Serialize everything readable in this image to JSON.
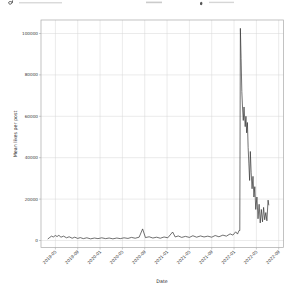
{
  "chart_data": {
    "type": "line",
    "xlabel": "Date",
    "ylabel": "Mean likes per post",
    "grid": true,
    "legend": "none",
    "line_color": "#333333",
    "grid_color": "#d6d6d6",
    "spine_color": "#a8a8a8",
    "xlim": [
      "2019-02-15",
      "2022-10-01"
    ],
    "ylim": [
      -3500,
      106500
    ],
    "x_tick_labels": [
      "2019-05",
      "2019-09",
      "2020-01",
      "2020-05",
      "2020-09",
      "2021-01",
      "2021-05",
      "2021-09",
      "2022-01",
      "2022-05",
      "2022-09"
    ],
    "y_ticks": [
      [
        0,
        "0"
      ],
      [
        20000,
        "20000"
      ],
      [
        40000,
        "40000"
      ],
      [
        60000,
        "60000"
      ],
      [
        80000,
        "80000"
      ],
      [
        100000,
        "100000"
      ]
    ],
    "series": [
      {
        "name": "mean-likes-per-post",
        "points": [
          [
            "2019-03-20",
            700
          ],
          [
            "2019-04-01",
            1500
          ],
          [
            "2019-04-10",
            2100
          ],
          [
            "2019-04-20",
            1700
          ],
          [
            "2019-05-01",
            2400
          ],
          [
            "2019-05-10",
            1900
          ],
          [
            "2019-05-20",
            2500
          ],
          [
            "2019-06-01",
            1600
          ],
          [
            "2019-06-15",
            2100
          ],
          [
            "2019-07-01",
            1300
          ],
          [
            "2019-07-15",
            1800
          ],
          [
            "2019-08-01",
            1100
          ],
          [
            "2019-08-15",
            1600
          ],
          [
            "2019-09-01",
            1000
          ],
          [
            "2019-09-15",
            1400
          ],
          [
            "2019-10-01",
            900
          ],
          [
            "2019-10-20",
            1300
          ],
          [
            "2019-11-10",
            800
          ],
          [
            "2019-12-01",
            1200
          ],
          [
            "2019-12-20",
            900
          ],
          [
            "2020-01-10",
            1300
          ],
          [
            "2020-02-01",
            900
          ],
          [
            "2020-02-20",
            1200
          ],
          [
            "2020-03-10",
            800
          ],
          [
            "2020-04-01",
            1200
          ],
          [
            "2020-04-20",
            900
          ],
          [
            "2020-05-10",
            1300
          ],
          [
            "2020-06-01",
            1000
          ],
          [
            "2020-06-20",
            1500
          ],
          [
            "2020-07-10",
            1100
          ],
          [
            "2020-08-01",
            1600
          ],
          [
            "2020-08-20",
            5600
          ],
          [
            "2020-09-05",
            1400
          ],
          [
            "2020-09-25",
            1800
          ],
          [
            "2020-10-15",
            1200
          ],
          [
            "2020-11-05",
            1600
          ],
          [
            "2020-11-25",
            1100
          ],
          [
            "2020-12-15",
            1700
          ],
          [
            "2021-01-05",
            1300
          ],
          [
            "2021-02-01",
            4100
          ],
          [
            "2021-02-15",
            1700
          ],
          [
            "2021-03-01",
            2200
          ],
          [
            "2021-03-20",
            1500
          ],
          [
            "2021-04-10",
            2000
          ],
          [
            "2021-05-01",
            1500
          ],
          [
            "2021-05-20",
            2300
          ],
          [
            "2021-06-10",
            1600
          ],
          [
            "2021-07-01",
            2200
          ],
          [
            "2021-07-20",
            1700
          ],
          [
            "2021-08-10",
            2100
          ],
          [
            "2021-09-01",
            1600
          ],
          [
            "2021-09-20",
            2400
          ],
          [
            "2021-10-10",
            1800
          ],
          [
            "2021-11-01",
            2600
          ],
          [
            "2021-11-20",
            2100
          ],
          [
            "2021-12-10",
            3200
          ],
          [
            "2021-12-25",
            2600
          ],
          [
            "2022-01-10",
            4200
          ],
          [
            "2022-01-20",
            3100
          ],
          [
            "2022-01-28",
            4800
          ],
          [
            "2022-02-02",
            4800
          ],
          [
            "2022-02-05",
            102500
          ],
          [
            "2022-02-09",
            88000
          ],
          [
            "2022-02-13",
            72000
          ],
          [
            "2022-02-17",
            64000
          ],
          [
            "2022-02-21",
            58000
          ],
          [
            "2022-02-25",
            64500
          ],
          [
            "2022-03-01",
            55000
          ],
          [
            "2022-03-05",
            60000
          ],
          [
            "2022-03-09",
            52000
          ],
          [
            "2022-03-13",
            57000
          ],
          [
            "2022-03-17",
            45000
          ],
          [
            "2022-03-21",
            37000
          ],
          [
            "2022-03-25",
            29000
          ],
          [
            "2022-03-29",
            43000
          ],
          [
            "2022-04-03",
            33000
          ],
          [
            "2022-04-08",
            25000
          ],
          [
            "2022-04-13",
            31000
          ],
          [
            "2022-04-18",
            21000
          ],
          [
            "2022-04-23",
            26000
          ],
          [
            "2022-04-28",
            15000
          ],
          [
            "2022-05-04",
            21000
          ],
          [
            "2022-05-10",
            10500
          ],
          [
            "2022-05-16",
            17500
          ],
          [
            "2022-05-22",
            8500
          ],
          [
            "2022-05-28",
            15000
          ],
          [
            "2022-06-04",
            9000
          ],
          [
            "2022-06-10",
            16000
          ],
          [
            "2022-06-16",
            10000
          ],
          [
            "2022-06-22",
            13500
          ],
          [
            "2022-06-28",
            9500
          ],
          [
            "2022-07-04",
            19500
          ],
          [
            "2022-07-08",
            17000
          ]
        ]
      }
    ]
  }
}
